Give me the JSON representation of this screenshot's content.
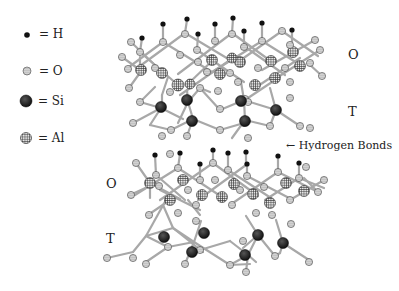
{
  "legend": [
    {
      "symbol": "H",
      "label": "= H",
      "style": "solid-small-black"
    },
    {
      "symbol": "O",
      "label": "= O",
      "style": "dotted-gray"
    },
    {
      "symbol": "Si",
      "label": "= Si",
      "style": "solid-large-dark"
    },
    {
      "symbol": "Al",
      "label": "= Al",
      "style": "crosshatch-gray"
    }
  ],
  "layer_labels": {
    "upper_sheet": {
      "octahedral": "O",
      "tetrahedral": "T"
    },
    "lower_sheet": {
      "octahedral": "O",
      "tetrahedral": "T"
    }
  },
  "annotation": {
    "arrow": "←",
    "text": "Hydrogen Bonds"
  },
  "colors": {
    "hydrogen": "#111111",
    "oxygen_fill": "#d8d8d8",
    "silicon": "#222222",
    "aluminum_fill": "#bdbdbd",
    "bond": "#9a9a9a"
  }
}
